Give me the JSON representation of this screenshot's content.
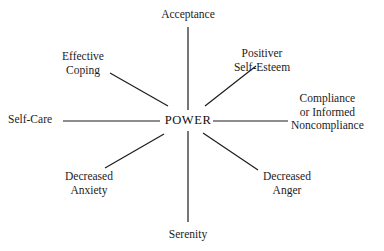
{
  "diagram": {
    "title": "POWER",
    "type": "hub-and-spoke",
    "hub": {
      "label": "POWER",
      "x": 188,
      "y": 121
    },
    "style": {
      "background_color": "#ffffff",
      "line_color": "#1c1c1c",
      "text_color": "#1c1c1c",
      "line_width": 1.2
    },
    "nodes": [
      {
        "name": "acceptance",
        "lines": [
          "Acceptance"
        ],
        "position": "top",
        "align": "ctr",
        "spoke": {
          "x1": 188,
          "y1": 110,
          "x2": 188,
          "y2": 27
        }
      },
      {
        "name": "positive-self-esteem",
        "lines": [
          "Positiver",
          "Self-Esteem"
        ],
        "position": "top-right",
        "align": "ctr",
        "spoke": {
          "x1": 205,
          "y1": 106,
          "x2": 256,
          "y2": 66
        }
      },
      {
        "name": "compliance-or-informed-noncompliance",
        "lines": [
          "Compliance",
          "or  Informed",
          "Noncompliance"
        ],
        "position": "right",
        "align": "ctr",
        "spoke": {
          "x1": 213,
          "y1": 121,
          "x2": 288,
          "y2": 121
        }
      },
      {
        "name": "decreased-anger",
        "lines": [
          "Decreased",
          "Anger"
        ],
        "position": "bottom-right",
        "align": "ctr",
        "spoke": {
          "x1": 203,
          "y1": 133,
          "x2": 258,
          "y2": 170
        }
      },
      {
        "name": "serenity",
        "lines": [
          "Serenity"
        ],
        "position": "bottom",
        "align": "ctr",
        "spoke": {
          "x1": 188,
          "y1": 131,
          "x2": 188,
          "y2": 222
        }
      },
      {
        "name": "decreased-anxiety",
        "lines": [
          "Decreased",
          "Anxiety"
        ],
        "position": "bottom-left",
        "align": "ctr",
        "spoke": {
          "x1": 164,
          "y1": 134,
          "x2": 105,
          "y2": 168
        }
      },
      {
        "name": "self-care",
        "lines": [
          "Self-Care"
        ],
        "position": "left",
        "align": "lft",
        "spoke": {
          "x1": 160,
          "y1": 121,
          "x2": 63,
          "y2": 121
        }
      },
      {
        "name": "effective-coping",
        "lines": [
          "Effective",
          "Coping"
        ],
        "position": "top-left",
        "align": "ctr",
        "spoke": {
          "x1": 168,
          "y1": 106,
          "x2": 110,
          "y2": 73
        }
      }
    ]
  }
}
